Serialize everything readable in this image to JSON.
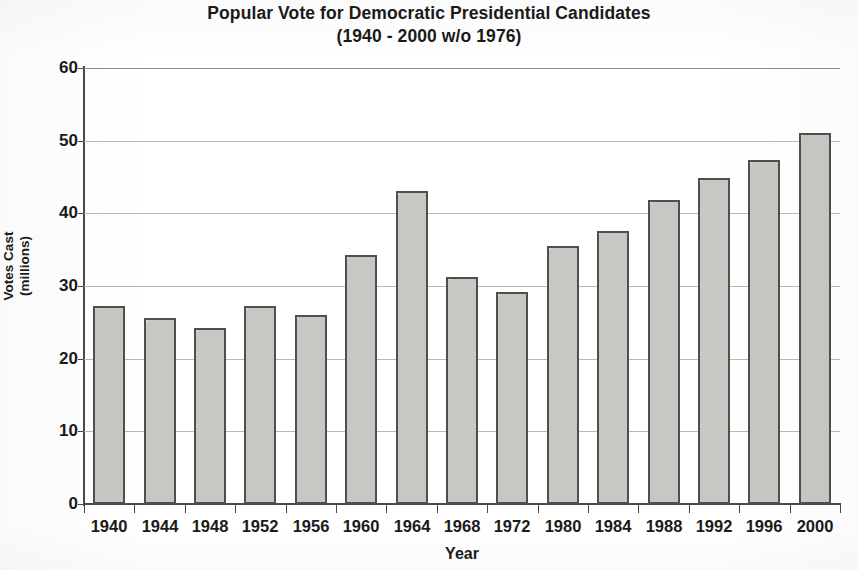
{
  "chart_data": {
    "type": "bar",
    "title": "Popular Vote for Democratic Presidential Candidates",
    "subtitle": "(1940 - 2000 w/o 1976)",
    "xlabel": "Year",
    "ylabel": "Votes Cast",
    "ylabel_line2": "(millions)",
    "categories": [
      "1940",
      "1944",
      "1948",
      "1952",
      "1956",
      "1960",
      "1964",
      "1968",
      "1972",
      "1980",
      "1984",
      "1988",
      "1992",
      "1996",
      "2000"
    ],
    "values": [
      27.3,
      25.6,
      24.2,
      27.3,
      26.0,
      34.2,
      43.1,
      31.3,
      29.2,
      35.5,
      37.6,
      41.8,
      44.9,
      47.4,
      51.0
    ],
    "ylim": [
      0,
      60
    ],
    "ytick_labels": [
      "0",
      "10",
      "20",
      "30",
      "40",
      "50",
      "60"
    ],
    "ytick_values": [
      0,
      10,
      20,
      30,
      40,
      50,
      60
    ],
    "grid": true,
    "grid_axis": "y",
    "legend": false,
    "bar_fill_color": "#cdcdc9",
    "bar_border_color": "#4f4f4d",
    "axis_color": "#4a4a48",
    "gridline_color": "#b9b9b4",
    "text_color": "#1a1a1a",
    "background_color": "#ffffff"
  }
}
